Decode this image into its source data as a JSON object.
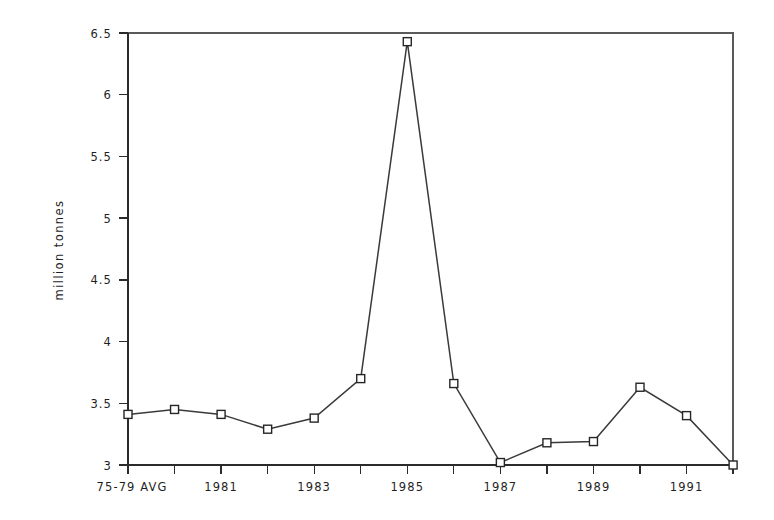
{
  "chart_data": {
    "type": "line",
    "title": "",
    "subtitle": "",
    "xlabel": "",
    "ylabel": "million tonnes",
    "categories": [
      "75-79 AVG",
      "1980",
      "1981",
      "1982",
      "1983",
      "1984",
      "1985",
      "1986",
      "1987",
      "1988",
      "1989",
      "1990",
      "1991",
      "1992"
    ],
    "x_tick_labels": [
      "75-79 AVG",
      "",
      "1981",
      "",
      "1983",
      "",
      "1985",
      "",
      "1987",
      "",
      "1989",
      "",
      "1991",
      ""
    ],
    "values": [
      3.41,
      3.45,
      3.41,
      3.29,
      3.38,
      3.7,
      6.43,
      3.66,
      3.02,
      3.18,
      3.19,
      3.63,
      3.4,
      3.0
    ],
    "series": [
      {
        "name": "million tonnes",
        "values": [
          3.41,
          3.45,
          3.41,
          3.29,
          3.38,
          3.7,
          6.43,
          3.66,
          3.02,
          3.18,
          3.19,
          3.63,
          3.4,
          3.0
        ]
      }
    ],
    "ylim": [
      3,
      6.5
    ],
    "y_ticks": [
      3,
      3.5,
      4,
      4.5,
      5,
      5.5,
      6,
      6.5
    ],
    "y_tick_labels": [
      "3",
      "3.5",
      "4",
      "4.5",
      "5",
      "5.5",
      "6",
      "6.5"
    ],
    "grid": false,
    "legend": false,
    "legend_position": "none",
    "marker": "open-square",
    "line_color": "#3a3a3a",
    "marker_fill": "#ffffff",
    "marker_edge_color": "#262626",
    "background_color": "#ffffff",
    "annotations": []
  },
  "axes": {
    "y_title": "million tonnes"
  }
}
